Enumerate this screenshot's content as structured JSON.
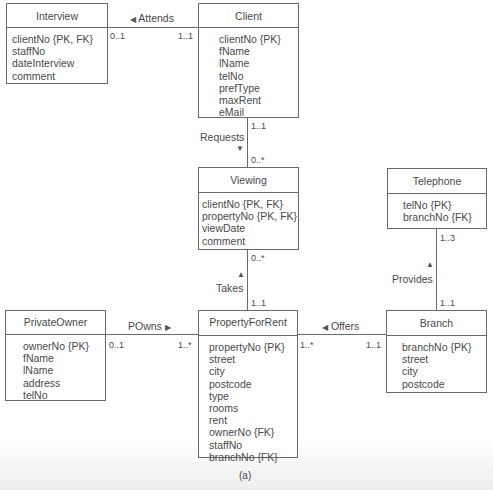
{
  "diagram": {
    "caption": "(a)",
    "entities": {
      "interview": {
        "name": "Interview",
        "attributes": [
          "clientNo {PK, FK}",
          "staffNo",
          "dateInterview",
          "comment"
        ]
      },
      "client": {
        "name": "Client",
        "attributes": [
          "clientNo {PK}",
          "fName",
          "lName",
          "telNo",
          "prefType",
          "maxRent",
          "eMail"
        ]
      },
      "viewing": {
        "name": "Viewing",
        "attributes": [
          "clientNo {PK, FK}",
          "propertyNo {PK, FK}",
          "viewDate",
          "comment"
        ]
      },
      "telephone": {
        "name": "Telephone",
        "attributes": [
          "telNo {PK}",
          "branchNo {FK}"
        ]
      },
      "privateowner": {
        "name": "PrivateOwner",
        "attributes": [
          "ownerNo {PK}",
          "fName",
          "lName",
          "address",
          "telNo"
        ]
      },
      "propertyforrent": {
        "name": "PropertyForRent",
        "attributes": [
          "propertyNo {PK}",
          "street",
          "city",
          "postcode",
          "type",
          "rooms",
          "rent",
          "ownerNo {FK}",
          "staffNo",
          "branchNo {FK}"
        ]
      },
      "branch": {
        "name": "Branch",
        "attributes": [
          "branchNo {PK}",
          "street",
          "city",
          "postcode"
        ]
      }
    },
    "relationships": {
      "attends": {
        "label": "Attends",
        "direction_arrow": "◀",
        "from": "Interview",
        "to": "Client",
        "from_mult": "0..1",
        "to_mult": "1..1"
      },
      "requests": {
        "label": "Requests",
        "direction_arrow": "▼",
        "from": "Client",
        "to": "Viewing",
        "from_mult": "1..1",
        "to_mult": "0..*"
      },
      "takes": {
        "label": "Takes",
        "direction_arrow": "▲",
        "from": "Viewing",
        "to": "PropertyForRent",
        "from_mult": "0..*",
        "to_mult": "1..1"
      },
      "provides": {
        "label": "Provides",
        "direction_arrow": "▲",
        "from": "Telephone",
        "to": "Branch",
        "from_mult": "1..3",
        "to_mult": "1..1"
      },
      "powns": {
        "label": "POwns",
        "direction_arrow": "▶",
        "from": "PrivateOwner",
        "to": "PropertyForRent",
        "from_mult": "0..1",
        "to_mult": "1..*"
      },
      "offers": {
        "label": "Offers",
        "direction_arrow": "◀",
        "from": "PropertyForRent",
        "to": "Branch",
        "from_mult": "1..*",
        "to_mult": "1..1"
      }
    }
  }
}
